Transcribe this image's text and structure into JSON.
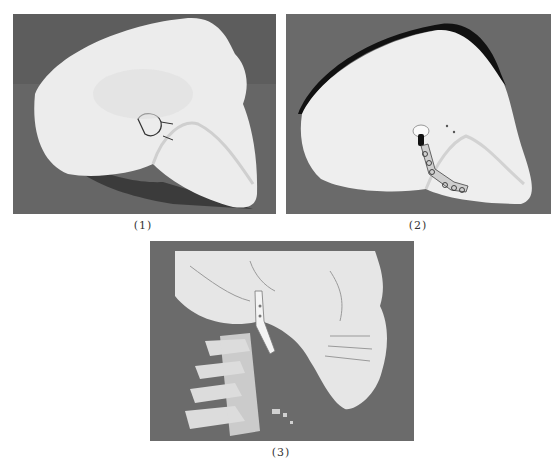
{
  "figure": {
    "panels": [
      {
        "id": "1",
        "caption": "(1)",
        "description": "Photograph of a 3D-printed skull model, left lateral view, with a marked condylar region near the ear",
        "background_color": "#5f5f5f",
        "subject_color": "#ececec"
      },
      {
        "id": "2",
        "caption": "(2)",
        "description": "Photograph of a 3D-printed skull model, lateral view, with a temporomandibular joint prosthesis and fixation plate with screws on the mandibular ramus",
        "background_color": "#6a6a6a",
        "subject_color": "#eeeeee",
        "implant_screws_visible": 7
      },
      {
        "id": "3",
        "caption": "(3)",
        "description": "3D CT reconstruction of the skull and cervical spine, lateral view, showing the implanted joint prosthesis on the mandible",
        "background_color": "#6b6b6b",
        "subject_color": "#e6e6e6"
      }
    ]
  }
}
